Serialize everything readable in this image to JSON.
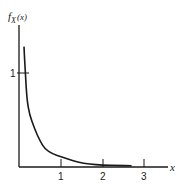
{
  "chart_data": {
    "type": "line",
    "title": "",
    "xlabel": "x",
    "ylabel": "f_X(x)",
    "ylabel_parts": {
      "f": "f",
      "sub": "X",
      "arg": "(x)"
    },
    "xlim": [
      0,
      3.4
    ],
    "ylim": [
      0,
      1.3
    ],
    "grid": false,
    "legend": null,
    "x_ticks": [
      {
        "value": 1,
        "label": "1"
      },
      {
        "value": 2,
        "label": "2"
      },
      {
        "value": 3,
        "label": "3"
      }
    ],
    "y_ticks": [
      {
        "value": 1,
        "label": "1"
      }
    ],
    "series": [
      {
        "name": "f_X(x)",
        "description": "Decreasing density with vertical asymptote near x = 0, decaying to ~0 by x ≈ 2",
        "x": [
          0.12,
          0.15,
          0.19,
          0.25,
          0.38,
          0.5,
          0.62,
          0.8,
          1.0,
          1.2,
          1.4,
          1.7,
          2.0,
          2.4,
          2.7
        ],
        "y": [
          1.27,
          1.0,
          0.71,
          0.55,
          0.39,
          0.27,
          0.18,
          0.13,
          0.1,
          0.07,
          0.04,
          0.02,
          0.01,
          0.005,
          0.003
        ]
      }
    ]
  }
}
